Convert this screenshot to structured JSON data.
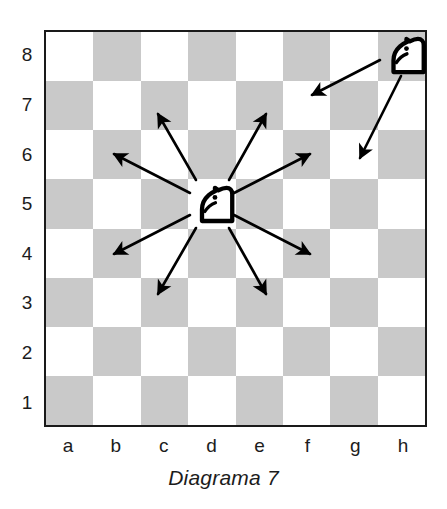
{
  "caption": "Diagrama 7",
  "board": {
    "file_labels": [
      "a",
      "b",
      "c",
      "d",
      "e",
      "f",
      "g",
      "h"
    ],
    "rank_labels": [
      "8",
      "7",
      "6",
      "5",
      "4",
      "3",
      "2",
      "1"
    ],
    "light_color": "#ffffff",
    "dark_color": "#c9c9c9",
    "border_color": "#1a1a1a",
    "orientation": "white-bottom",
    "a8_square_color": "light"
  },
  "pieces": [
    {
      "name": "knight",
      "color": "white",
      "square": "d4"
    },
    {
      "name": "knight",
      "color": "white",
      "square": "h8"
    }
  ],
  "arrows": [
    {
      "from": "d4",
      "to": "c6",
      "color": "#000000"
    },
    {
      "from": "d4",
      "to": "e6",
      "color": "#000000"
    },
    {
      "from": "d4",
      "to": "b5",
      "color": "#000000"
    },
    {
      "from": "d4",
      "to": "f5",
      "color": "#000000"
    },
    {
      "from": "d4",
      "to": "b3",
      "color": "#000000"
    },
    {
      "from": "d4",
      "to": "f3",
      "color": "#000000"
    },
    {
      "from": "d4",
      "to": "c2",
      "color": "#000000"
    },
    {
      "from": "d4",
      "to": "e2",
      "color": "#000000"
    },
    {
      "from": "h8",
      "to": "f7",
      "color": "#000000"
    },
    {
      "from": "h8",
      "to": "g6",
      "color": "#000000"
    }
  ],
  "chart_data": {
    "type": "diagram",
    "title": "Diagrama 7",
    "categories": [
      "a",
      "b",
      "c",
      "d",
      "e",
      "f",
      "g",
      "h"
    ],
    "ranks": [
      "1",
      "2",
      "3",
      "4",
      "5",
      "6",
      "7",
      "8"
    ],
    "pieces": [
      {
        "piece": "N",
        "square": "d4"
      },
      {
        "piece": "N",
        "square": "h8"
      }
    ],
    "moves_from_d4": [
      "c6",
      "e6",
      "b5",
      "f5",
      "b3",
      "f3",
      "c2",
      "e2"
    ],
    "moves_from_h8": [
      "f7",
      "g6"
    ],
    "move_count_d4": 8,
    "move_count_h8": 2
  }
}
